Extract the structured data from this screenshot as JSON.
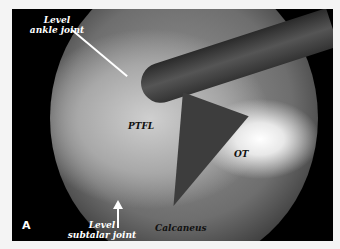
{
  "figure": {
    "panel_letter": "A",
    "labels": {
      "ankle": "Level ankle joint",
      "ankle_line1": "Level",
      "ankle_line2": "ankle joint",
      "ptfl": "PTFL",
      "ot": "OT",
      "subtalar_line1": "Level",
      "subtalar_line2": "subtalar joint",
      "calcaneus": "Calcaneus"
    }
  }
}
